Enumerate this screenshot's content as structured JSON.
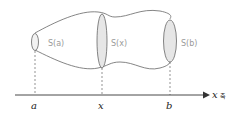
{
  "diagram": {
    "sections": [
      {
        "label": "S(a)"
      },
      {
        "label": "S(x)"
      },
      {
        "label": "S(b)"
      }
    ],
    "axis": {
      "label": "x",
      "suffix": "축",
      "ticks": [
        "a",
        "x",
        "b"
      ]
    },
    "colors": {
      "outline": "#555555",
      "section_fill": "#e6e6e6",
      "label": "#9a9a9a",
      "axis": "#333333"
    }
  }
}
